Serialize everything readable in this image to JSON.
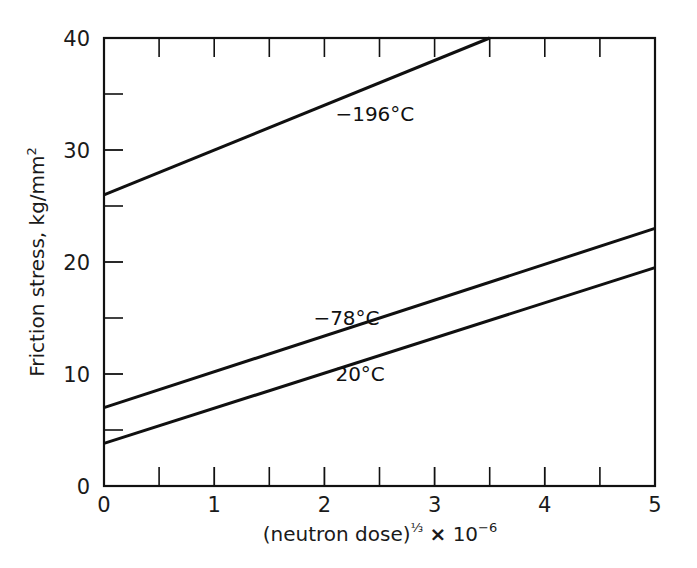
{
  "chart_data": {
    "type": "line",
    "title": "",
    "xlabel": "(neutron dose)⅓ × 10⁻⁶",
    "xlabel_parts": {
      "base": "(neutron dose)",
      "exponent": "⅓",
      "times": "×",
      "mantissa": "10",
      "power": "−6"
    },
    "ylabel": "Friction stress, kg/mm",
    "ylabel_exponent": "2",
    "xlim": [
      0,
      5
    ],
    "ylim": [
      0,
      40
    ],
    "x_major_ticks": [
      0,
      1,
      2,
      3,
      4,
      5
    ],
    "x_major_tick_labels": [
      "0",
      "1",
      "2",
      "3",
      "4",
      "5"
    ],
    "x_minor_ticks": [
      0.5,
      1.5,
      2.5,
      3.5,
      4.5
    ],
    "y_major_ticks": [
      0,
      10,
      20,
      30,
      40
    ],
    "y_major_tick_labels": [
      "0",
      "10",
      "20",
      "30",
      "40"
    ],
    "y_minor_ticks": [
      5,
      15,
      25,
      35
    ],
    "grid": false,
    "legend_position": "inline-labels",
    "frame": "box",
    "series": [
      {
        "name": "−196°C",
        "label": "−196°C",
        "label_x": 2.1,
        "label_y": 32.6,
        "color": "#101010",
        "x": [
          0,
          3.5
        ],
        "y": [
          26.0,
          40.0
        ],
        "intercept": 26.0,
        "slope": 4.0
      },
      {
        "name": "−78°C",
        "label": "−78°C",
        "label_x": 1.9,
        "label_y": 14.4,
        "color": "#101010",
        "x": [
          0,
          5
        ],
        "y": [
          7.0,
          23.0
        ],
        "intercept": 7.0,
        "slope": 3.2
      },
      {
        "name": "20°C",
        "label": "20°C",
        "label_x": 2.1,
        "label_y": 9.4,
        "color": "#101010",
        "x": [
          0,
          5
        ],
        "y": [
          3.8,
          19.5
        ],
        "intercept": 3.8,
        "slope": 3.14
      }
    ]
  },
  "figure": {
    "background_color": "#ffffff",
    "axis_color": "#111111",
    "text_color": "#1a1a1a"
  }
}
